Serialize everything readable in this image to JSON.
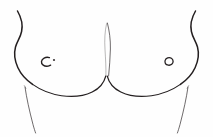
{
  "image": {
    "title": "Female chest line drawing",
    "medium": "pen and ink line art",
    "subject": "anterior view of female breasts and lower chest",
    "width_px": 213,
    "height_px": 137,
    "background_color": "#fefefe",
    "ink_color": "#241f20",
    "accent_dot_color": "#3a3334",
    "style_notes": "sparse contour-only sketch, no shading or hatching, white ground"
  },
  "strokes": {
    "left_outer_contour": {
      "name": "left axilla to lateral breast contour",
      "label": "left outer contour"
    },
    "left_underbust": {
      "name": "left inframammary fold",
      "label": "left underbust curve"
    },
    "left_flank": {
      "name": "left lateral torso line",
      "label": "left flank line"
    },
    "right_outer_contour": {
      "name": "right axilla to lateral breast contour",
      "label": "right outer contour"
    },
    "right_underbust": {
      "name": "right inframammary fold",
      "label": "right underbust curve"
    },
    "right_flank": {
      "name": "right lateral torso line",
      "label": "right flank line"
    },
    "cleavage_left": {
      "name": "medial left breast line",
      "label": "left cleavage line"
    },
    "cleavage_right": {
      "name": "medial right breast line",
      "label": "right cleavage line"
    }
  },
  "features": {
    "left_nipple": {
      "label": "left nipple",
      "glyph": "crescent-c",
      "description": "open C-shaped crescent facing right with a small dot at upper right",
      "center": {
        "x": 46,
        "y": 61
      },
      "radius_px": 4.2,
      "dot": {
        "x": 54,
        "y": 60,
        "r": 1.1
      }
    },
    "right_nipple": {
      "label": "right nipple",
      "glyph": "open-ring",
      "description": "small open ring with a gap at the lower left, slight spiral tail",
      "center": {
        "x": 168,
        "y": 61
      },
      "radius_px": 3.6
    }
  },
  "annotations": {
    "alt_text": "A minimal black ink line drawing on white showing the front of a female chest: two symmetric breast contours with nipples and a short central cleavage, plus light torso lines descending at the lower left and lower right.",
    "caption": ""
  }
}
